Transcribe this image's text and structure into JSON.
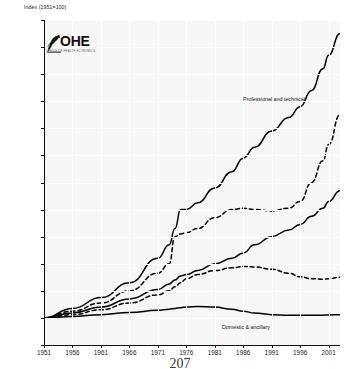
{
  "page": {
    "page_number": "207"
  },
  "logo": {
    "name": "OHE",
    "wordmark": "OHE",
    "subtitle": "OFFICE OF HEALTH ECONOMICS"
  },
  "chart_data": {
    "type": "line",
    "title": "",
    "ylabel": "Index (1951=100)",
    "xlabel": "",
    "ylim": [
      0,
      1200
    ],
    "xlim": [
      1951,
      2003
    ],
    "grid": true,
    "legend": "inline-annotations",
    "yticks": [
      0,
      100,
      200,
      300,
      400,
      500,
      600,
      700,
      800,
      900,
      1000,
      1100,
      1200
    ],
    "ytick_labels": [
      "0",
      "100",
      "200",
      "300",
      "400",
      "500",
      "600",
      "700",
      "800",
      "900",
      "1000",
      "1100",
      "1200"
    ],
    "xticks": [
      1951,
      1956,
      1961,
      1966,
      1971,
      1976,
      1981,
      1986,
      1991,
      1996,
      2001
    ],
    "xtick_labels": [
      "1951",
      "1956",
      "1961",
      "1966",
      "1971",
      "1976",
      "1981",
      "1986",
      "1991",
      "1996",
      "2001"
    ],
    "annotations": [
      {
        "text": "Professional and technical",
        "x": 1988,
        "y": 930
      },
      {
        "text": "Domestic & ancillary",
        "x": 1984,
        "y": 80
      }
    ],
    "series": [
      {
        "name": "Professional and technical",
        "style": "solid",
        "color": "#000000",
        "x": [
          1951,
          1956,
          1961,
          1966,
          1971,
          1973,
          1974,
          1975,
          1976,
          1978,
          1981,
          1984,
          1986,
          1988,
          1991,
          1994,
          1996,
          1998,
          2000,
          2001,
          2003
        ],
        "values": [
          100,
          135,
          175,
          230,
          320,
          370,
          430,
          500,
          500,
          525,
          580,
          640,
          690,
          730,
          790,
          840,
          880,
          940,
          1020,
          1070,
          1150
        ]
      },
      {
        "name": "Series 2",
        "style": "dashed",
        "color": "#000000",
        "x": [
          1951,
          1956,
          1961,
          1966,
          1971,
          1973,
          1974,
          1975,
          1976,
          1978,
          1981,
          1984,
          1986,
          1988,
          1991,
          1994,
          1996,
          1998,
          2000,
          2001,
          2003
        ],
        "values": [
          100,
          125,
          155,
          200,
          265,
          300,
          400,
          410,
          415,
          430,
          470,
          500,
          505,
          500,
          495,
          505,
          530,
          600,
          680,
          740,
          850
        ]
      },
      {
        "name": "Series 3",
        "style": "solid",
        "color": "#000000",
        "x": [
          1951,
          1956,
          1961,
          1966,
          1971,
          1973,
          1974,
          1975,
          1976,
          1978,
          1981,
          1984,
          1986,
          1988,
          1991,
          1994,
          1996,
          1998,
          2000,
          2001,
          2003
        ],
        "values": [
          100,
          118,
          140,
          170,
          205,
          225,
          240,
          255,
          260,
          275,
          300,
          320,
          340,
          370,
          400,
          425,
          445,
          475,
          505,
          530,
          570
        ]
      },
      {
        "name": "Series 4",
        "style": "dashed",
        "color": "#000000",
        "x": [
          1951,
          1956,
          1961,
          1966,
          1971,
          1973,
          1974,
          1975,
          1976,
          1978,
          1981,
          1984,
          1986,
          1988,
          1991,
          1994,
          1996,
          1998,
          2000,
          2001,
          2003
        ],
        "values": [
          100,
          112,
          130,
          155,
          185,
          200,
          215,
          230,
          245,
          260,
          275,
          285,
          290,
          288,
          280,
          265,
          252,
          245,
          243,
          245,
          250
        ]
      },
      {
        "name": "Domestic & ancillary",
        "style": "solid",
        "color": "#000000",
        "x": [
          1951,
          1956,
          1961,
          1966,
          1971,
          1973,
          1974,
          1975,
          1976,
          1978,
          1981,
          1984,
          1986,
          1988,
          1991,
          1994,
          1996,
          1998,
          2000,
          2001,
          2003
        ],
        "values": [
          100,
          105,
          112,
          120,
          128,
          132,
          135,
          138,
          140,
          142,
          140,
          132,
          125,
          118,
          112,
          110,
          110,
          110,
          110,
          111,
          112
        ]
      }
    ]
  }
}
